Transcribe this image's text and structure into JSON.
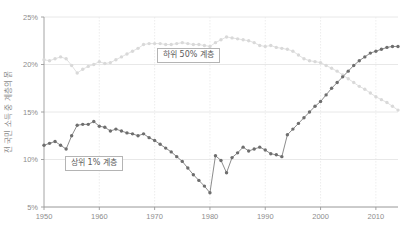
{
  "chart_data": {
    "type": "line",
    "title": "",
    "subtitle": "",
    "xlabel": "",
    "ylabel": "전 국민 소득 중 계층의 몱",
    "xlim": [
      1950,
      2014
    ],
    "ylim": [
      5,
      25
    ],
    "yticks": [
      5,
      10,
      15,
      20,
      25
    ],
    "ytick_labels": [
      "5%",
      "10%",
      "15%",
      "20%",
      "25%"
    ],
    "xticks": [
      1950,
      1960,
      1970,
      1980,
      1990,
      2000,
      2010
    ],
    "xtick_labels": [
      "1950",
      "1960",
      "1970",
      "1980",
      "1990",
      "2000",
      "2010"
    ],
    "grid": true,
    "legend_position": "inline-annotations",
    "series": [
      {
        "name": "하위 50% 계층",
        "color": "#d9d9d9",
        "marker": "circle",
        "x": [
          1950,
          1951,
          1952,
          1953,
          1954,
          1955,
          1956,
          1957,
          1958,
          1959,
          1960,
          1961,
          1962,
          1963,
          1964,
          1965,
          1966,
          1967,
          1968,
          1969,
          1970,
          1971,
          1972,
          1973,
          1974,
          1975,
          1976,
          1977,
          1978,
          1979,
          1980,
          1981,
          1982,
          1983,
          1984,
          1985,
          1986,
          1987,
          1988,
          1989,
          1990,
          1991,
          1992,
          1993,
          1994,
          1995,
          1996,
          1997,
          1998,
          1999,
          2000,
          2001,
          2002,
          2003,
          2004,
          2005,
          2006,
          2007,
          2008,
          2009,
          2010,
          2011,
          2012,
          2013,
          2014
        ],
        "values": [
          20.5,
          20.4,
          20.6,
          20.8,
          20.6,
          19.9,
          19.1,
          19.5,
          19.8,
          20.0,
          20.3,
          20.1,
          20.2,
          20.5,
          20.8,
          21.1,
          21.4,
          21.7,
          22.1,
          22.2,
          22.2,
          22.2,
          22.1,
          22.1,
          22.2,
          22.3,
          22.2,
          22.1,
          22.1,
          22.0,
          21.9,
          22.3,
          22.6,
          22.9,
          22.8,
          22.7,
          22.6,
          22.5,
          22.3,
          22.0,
          21.9,
          22.0,
          21.8,
          21.7,
          21.6,
          21.4,
          21.0,
          20.6,
          20.4,
          20.3,
          20.2,
          19.9,
          19.6,
          19.3,
          18.9,
          18.5,
          18.1,
          17.7,
          17.4,
          17.0,
          16.6,
          16.3,
          16.0,
          15.6,
          15.2
        ]
      },
      {
        "name": "상위 1% 계층",
        "color": "#6e6e6e",
        "marker": "circle",
        "x": [
          1950,
          1951,
          1952,
          1953,
          1954,
          1955,
          1956,
          1957,
          1958,
          1959,
          1960,
          1961,
          1962,
          1963,
          1964,
          1965,
          1966,
          1967,
          1968,
          1969,
          1970,
          1971,
          1972,
          1973,
          1974,
          1975,
          1976,
          1977,
          1978,
          1979,
          1980,
          1981,
          1982,
          1983,
          1984,
          1985,
          1986,
          1987,
          1988,
          1989,
          1990,
          1991,
          1992,
          1993,
          1994,
          1995,
          1996,
          1997,
          1998,
          1999,
          2000,
          2001,
          2002,
          2003,
          2004,
          2005,
          2006,
          2007,
          2008,
          2009,
          2010,
          2011,
          2012,
          2013,
          2014
        ],
        "values": [
          11.5,
          11.7,
          11.9,
          11.5,
          11.1,
          12.5,
          13.6,
          13.7,
          13.7,
          14.0,
          13.5,
          13.4,
          13.0,
          13.2,
          13.0,
          12.8,
          12.7,
          12.5,
          12.7,
          12.3,
          12.0,
          11.6,
          11.2,
          10.8,
          10.3,
          9.8,
          9.1,
          8.4,
          7.8,
          7.2,
          6.5,
          10.4,
          9.9,
          8.6,
          10.2,
          10.7,
          11.3,
          10.9,
          11.1,
          11.3,
          11.0,
          10.6,
          10.5,
          10.3,
          12.6,
          13.2,
          13.8,
          14.4,
          15.0,
          15.6,
          16.1,
          16.8,
          17.5,
          18.1,
          18.7,
          19.3,
          19.9,
          20.4,
          20.8,
          21.2,
          21.4,
          21.6,
          21.8,
          21.9,
          21.9
        ]
      }
    ],
    "annotations": [
      {
        "id": "bottom50",
        "text": "하위 50% 계층"
      },
      {
        "id": "top1",
        "text": "상위 1% 계층"
      }
    ]
  }
}
